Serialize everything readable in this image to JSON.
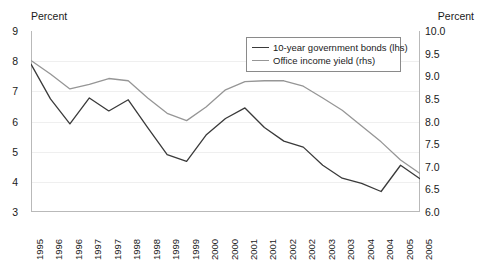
{
  "chart_data": {
    "type": "line",
    "title": "",
    "xlabel": "",
    "ylabel": "Percent",
    "ylabel_right": "Percent",
    "grid": true,
    "legend_position": "top-center-right",
    "left_axis": {
      "label": "Percent",
      "ylim": [
        3,
        9
      ],
      "ticks": [
        "3",
        "4",
        "5",
        "6",
        "7",
        "8",
        "9"
      ],
      "tick_values": [
        3,
        4,
        5,
        6,
        7,
        8,
        9
      ]
    },
    "right_axis": {
      "label": "Percent",
      "ylim": [
        6.0,
        10.0
      ],
      "ticks": [
        "6.0",
        "6.5",
        "7.0",
        "7.5",
        "8.0",
        "8.5",
        "9.0",
        "9.5",
        "10.0"
      ],
      "tick_values": [
        6.0,
        6.5,
        7.0,
        7.5,
        8.0,
        8.5,
        9.0,
        9.5,
        10.0
      ]
    },
    "categories": [
      "1995",
      "1996",
      "1996",
      "1997",
      "1997",
      "1998",
      "1998",
      "1999",
      "1999",
      "2000",
      "2000",
      "2001",
      "2001",
      "2002",
      "2002",
      "2003",
      "2003",
      "2004",
      "2004",
      "2005",
      "2005"
    ],
    "series": [
      {
        "name": "10-year government bonds (lhs)",
        "axis": "left",
        "color": "#333333",
        "values": [
          7.9,
          6.75,
          5.92,
          6.78,
          6.35,
          6.72,
          5.8,
          4.9,
          4.68,
          5.55,
          6.1,
          6.45,
          5.8,
          5.35,
          5.15,
          4.55,
          4.12,
          3.95,
          3.68,
          4.55,
          4.1
        ]
      },
      {
        "name": "Office income yield (rhs)",
        "axis": "right",
        "color": "#969696",
        "values": [
          9.35,
          9.05,
          8.72,
          8.82,
          8.95,
          8.9,
          8.52,
          8.18,
          8.02,
          8.32,
          8.7,
          8.88,
          8.9,
          8.9,
          8.78,
          8.52,
          8.25,
          7.9,
          7.55,
          7.15,
          6.85
        ]
      }
    ]
  },
  "legend": {
    "entries": [
      {
        "label": "10-year government bonds (lhs)",
        "color": "#333333"
      },
      {
        "label": "Office income yield (rhs)",
        "color": "#969696"
      }
    ]
  },
  "labels": {
    "left_axis_title": "Percent",
    "right_axis_title": "Percent"
  }
}
